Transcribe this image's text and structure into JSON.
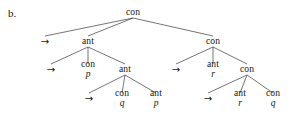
{
  "figure": {
    "label": "b.",
    "background_color": "#ffffff",
    "edge_color": "#3a3a3a",
    "text_color": "#161616",
    "width": 297,
    "height": 120
  },
  "tree": {
    "type": "syntax-tree",
    "nodes": [
      {
        "id": "n0",
        "label": "con",
        "sub": "",
        "x": 133,
        "y": 13,
        "row": 1
      },
      {
        "id": "n1",
        "label": "→",
        "sub": "",
        "x": 45,
        "y": 42,
        "row": 2
      },
      {
        "id": "n2",
        "label": "ant",
        "sub": "",
        "x": 88,
        "y": 42,
        "row": 2
      },
      {
        "id": "n3",
        "label": "con",
        "sub": "",
        "x": 213,
        "y": 42,
        "row": 2
      },
      {
        "id": "n4",
        "label": "→",
        "sub": "",
        "x": 51,
        "y": 70,
        "row": 3
      },
      {
        "id": "n5",
        "label": "con",
        "sub": "p",
        "x": 88,
        "y": 70,
        "row": 3
      },
      {
        "id": "n6",
        "label": "ant",
        "sub": "",
        "x": 125,
        "y": 70,
        "row": 3
      },
      {
        "id": "n7",
        "label": "→",
        "sub": "",
        "x": 176,
        "y": 70,
        "row": 3
      },
      {
        "id": "n8",
        "label": "ant",
        "sub": "r",
        "x": 213,
        "y": 70,
        "row": 3
      },
      {
        "id": "n9",
        "label": "con",
        "sub": "",
        "x": 247,
        "y": 70,
        "row": 3
      },
      {
        "id": "n10",
        "label": "→",
        "sub": "",
        "x": 89,
        "y": 99,
        "row": 4
      },
      {
        "id": "n11",
        "label": "con",
        "sub": "q",
        "x": 122,
        "y": 99,
        "row": 4
      },
      {
        "id": "n12",
        "label": "ant",
        "sub": "p",
        "x": 156,
        "y": 99,
        "row": 4
      },
      {
        "id": "n13",
        "label": "→",
        "sub": "",
        "x": 208,
        "y": 99,
        "row": 4
      },
      {
        "id": "n14",
        "label": "ant",
        "sub": "r",
        "x": 240,
        "y": 99,
        "row": 4
      },
      {
        "id": "n15",
        "label": "con",
        "sub": "q",
        "x": 273,
        "y": 99,
        "row": 4
      }
    ],
    "edges": [
      {
        "from": "n0",
        "to": "n1"
      },
      {
        "from": "n0",
        "to": "n2"
      },
      {
        "from": "n0",
        "to": "n3"
      },
      {
        "from": "n2",
        "to": "n4"
      },
      {
        "from": "n2",
        "to": "n5"
      },
      {
        "from": "n2",
        "to": "n6"
      },
      {
        "from": "n3",
        "to": "n7"
      },
      {
        "from": "n3",
        "to": "n8"
      },
      {
        "from": "n3",
        "to": "n9"
      },
      {
        "from": "n6",
        "to": "n10"
      },
      {
        "from": "n6",
        "to": "n11"
      },
      {
        "from": "n6",
        "to": "n12"
      },
      {
        "from": "n9",
        "to": "n13"
      },
      {
        "from": "n9",
        "to": "n14"
      },
      {
        "from": "n9",
        "to": "n15"
      }
    ]
  }
}
